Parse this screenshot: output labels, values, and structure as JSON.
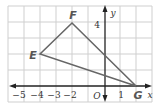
{
  "diagram": {
    "type": "coordinate-plane-triangle",
    "axes": {
      "x_label": "x",
      "y_label": "y",
      "origin_label": "O",
      "x_tick_labels": [
        "−5",
        "−4",
        "−3",
        "−2",
        "1"
      ],
      "y_tick_labels": [
        "4"
      ],
      "x_range": [
        -6,
        3
      ],
      "y_range": [
        -1,
        5
      ],
      "grid": true
    },
    "triangle": {
      "vertices": [
        {
          "name": "E",
          "x": -4,
          "y": 2
        },
        {
          "name": "F",
          "x": -2,
          "y": 4
        },
        {
          "name": "G",
          "x": 2,
          "y": 0
        }
      ],
      "stroke_color": "#666666"
    },
    "colors": {
      "grid": "#cfcfcf",
      "axis": "#222222",
      "triangle": "#666666",
      "vertex_label": "#555555"
    }
  }
}
